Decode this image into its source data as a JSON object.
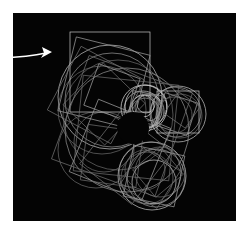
{
  "image": {
    "width": 246,
    "height": 228,
    "page_background": "#ffffff",
    "title": "Recursive circle and square generative drawing"
  },
  "canvas": {
    "name": "art-canvas",
    "x": 13,
    "y": 13,
    "width": 223,
    "height": 208,
    "background": "#040404",
    "border_color": "#e8e8e8"
  },
  "stroke": {
    "primary": "#c8c8c8",
    "secondary": "#9a9a9a",
    "faint": "#6e6e6e",
    "bright": "#e6e6e6",
    "width": 0.7
  },
  "annotation": {
    "arrow": {
      "name": "pointer-arrow",
      "color": "#ffffff",
      "start_x": 0,
      "start_y": 58,
      "tip_x": 52,
      "tip_y": 52,
      "label": ""
    }
  },
  "chart_data": {
    "type": "scatter",
    "xlabel": "",
    "ylabel": "",
    "xlim": [
      13,
      236
    ],
    "ylim": [
      13,
      221
    ],
    "grid": false,
    "legend": null,
    "void_center": {
      "cx": 133,
      "cy": 128,
      "r": 16
    },
    "circles": [
      {
        "cx": 110,
        "cy": 97,
        "r": 52,
        "shade": "primary"
      },
      {
        "cx": 112,
        "cy": 100,
        "r": 47,
        "shade": "secondary"
      },
      {
        "cx": 118,
        "cy": 115,
        "r": 55,
        "shade": "faint"
      },
      {
        "cx": 102,
        "cy": 110,
        "r": 44,
        "shade": "faint"
      },
      {
        "cx": 127,
        "cy": 130,
        "r": 62,
        "shade": "secondary"
      },
      {
        "cx": 144,
        "cy": 108,
        "r": 23,
        "shade": "bright"
      },
      {
        "cx": 146,
        "cy": 106,
        "r": 21,
        "shade": "bright"
      },
      {
        "cx": 143,
        "cy": 110,
        "r": 19,
        "shade": "primary"
      },
      {
        "cx": 147,
        "cy": 111,
        "r": 17,
        "shade": "primary"
      },
      {
        "cx": 145,
        "cy": 113,
        "r": 15,
        "shade": "secondary"
      },
      {
        "cx": 148,
        "cy": 108,
        "r": 13,
        "shade": "secondary"
      },
      {
        "cx": 143,
        "cy": 106,
        "r": 11,
        "shade": "bright"
      },
      {
        "cx": 146,
        "cy": 104,
        "r": 9,
        "shade": "primary"
      },
      {
        "cx": 178,
        "cy": 114,
        "r": 28,
        "shade": "primary"
      },
      {
        "cx": 176,
        "cy": 112,
        "r": 25,
        "shade": "secondary"
      },
      {
        "cx": 180,
        "cy": 116,
        "r": 22,
        "shade": "faint"
      },
      {
        "cx": 174,
        "cy": 115,
        "r": 18,
        "shade": "faint"
      },
      {
        "cx": 152,
        "cy": 176,
        "r": 34,
        "shade": "primary"
      },
      {
        "cx": 150,
        "cy": 173,
        "r": 31,
        "shade": "secondary"
      },
      {
        "cx": 156,
        "cy": 178,
        "r": 29,
        "shade": "secondary"
      },
      {
        "cx": 147,
        "cy": 178,
        "r": 26,
        "shade": "faint"
      },
      {
        "cx": 160,
        "cy": 172,
        "r": 25,
        "shade": "faint"
      },
      {
        "cx": 154,
        "cy": 182,
        "r": 22,
        "shade": "primary"
      },
      {
        "cx": 145,
        "cy": 170,
        "r": 20,
        "shade": "faint"
      },
      {
        "cx": 96,
        "cy": 150,
        "r": 38,
        "shade": "faint"
      },
      {
        "cx": 104,
        "cy": 142,
        "r": 30,
        "shade": "faint"
      }
    ],
    "squares": [
      {
        "cx": 110,
        "cy": 72,
        "size": 80,
        "rot": 0,
        "shade": "primary"
      },
      {
        "cx": 104,
        "cy": 83,
        "size": 76,
        "rot": 14,
        "shade": "secondary"
      },
      {
        "cx": 96,
        "cy": 95,
        "size": 72,
        "rot": 28,
        "shade": "faint"
      },
      {
        "cx": 104,
        "cy": 104,
        "size": 58,
        "rot": 44,
        "shade": "faint"
      },
      {
        "cx": 112,
        "cy": 92,
        "size": 44,
        "rot": 20,
        "shade": "secondary"
      },
      {
        "cx": 120,
        "cy": 150,
        "size": 78,
        "rot": 22,
        "shade": "secondary"
      },
      {
        "cx": 126,
        "cy": 158,
        "size": 66,
        "rot": 38,
        "shade": "faint"
      },
      {
        "cx": 112,
        "cy": 156,
        "size": 56,
        "rot": 8,
        "shade": "faint"
      },
      {
        "cx": 178,
        "cy": 112,
        "size": 42,
        "rot": 0,
        "shade": "primary"
      },
      {
        "cx": 176,
        "cy": 114,
        "size": 34,
        "rot": 18,
        "shade": "secondary"
      },
      {
        "cx": 182,
        "cy": 110,
        "size": 26,
        "rot": 35,
        "shade": "faint"
      },
      {
        "cx": 145,
        "cy": 108,
        "size": 30,
        "rot": 10,
        "shade": "secondary"
      },
      {
        "cx": 146,
        "cy": 110,
        "size": 24,
        "rot": 30,
        "shade": "faint"
      },
      {
        "cx": 154,
        "cy": 176,
        "size": 52,
        "rot": 12,
        "shade": "secondary"
      },
      {
        "cx": 150,
        "cy": 178,
        "size": 44,
        "rot": 32,
        "shade": "faint"
      },
      {
        "cx": 158,
        "cy": 172,
        "size": 36,
        "rot": 50,
        "shade": "faint"
      },
      {
        "cx": 126,
        "cy": 128,
        "size": 96,
        "rot": 6,
        "shade": "faint"
      },
      {
        "cx": 122,
        "cy": 126,
        "size": 110,
        "rot": 20,
        "shade": "faint"
      }
    ]
  }
}
